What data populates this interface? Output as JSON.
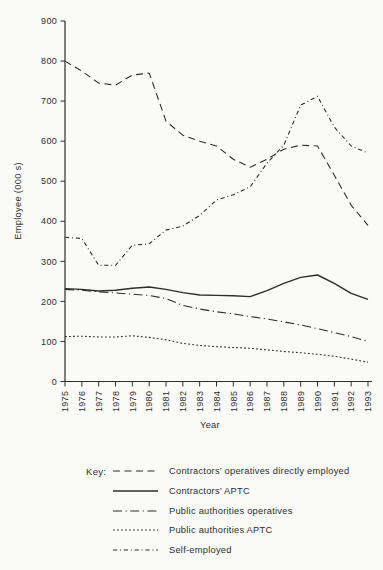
{
  "figure": {
    "y_axis_label": "Employee (000 s)",
    "x_axis_label": "Year"
  },
  "key": {
    "title": "Key:",
    "items": [
      {
        "label": "Contractors’ operatives directly employed",
        "style": "dashed"
      },
      {
        "label": "Contractors’ APTC",
        "style": "solid"
      },
      {
        "label": "Public authorities operatives",
        "style": "long-dash-dot"
      },
      {
        "label": "Public authorities APTC",
        "style": "dotted"
      },
      {
        "label": "Self-employed",
        "style": "dash-dot"
      }
    ]
  },
  "chart_data": {
    "type": "line",
    "title": "",
    "xlabel": "Year",
    "ylabel": "Employee (000 s)",
    "x": [
      1975,
      1976,
      1977,
      1978,
      1979,
      1980,
      1981,
      1982,
      1983,
      1984,
      1985,
      1986,
      1987,
      1988,
      1989,
      1990,
      1991,
      1992,
      1993
    ],
    "ylim": [
      0,
      900
    ],
    "ytick_step": 100,
    "grid": false,
    "legend_position": "below",
    "line_color": "#2e2e2e",
    "series": [
      {
        "name": "Contractors’ operatives directly employed",
        "style": "dashed",
        "values": [
          800,
          775,
          745,
          740,
          765,
          770,
          650,
          615,
          600,
          588,
          555,
          535,
          555,
          580,
          590,
          588,
          515,
          440,
          390
        ]
      },
      {
        "name": "Contractors’ APTC",
        "style": "solid",
        "values": [
          232,
          230,
          226,
          228,
          233,
          236,
          230,
          222,
          216,
          215,
          214,
          212,
          227,
          245,
          260,
          266,
          245,
          220,
          205
        ]
      },
      {
        "name": "Public authorities operatives",
        "style": "long-dash-dot",
        "values": [
          230,
          228,
          224,
          221,
          218,
          215,
          207,
          190,
          181,
          174,
          169,
          162,
          156,
          149,
          141,
          132,
          122,
          112,
          100
        ]
      },
      {
        "name": "Public authorities APTC",
        "style": "dotted",
        "values": [
          112,
          113,
          111,
          111,
          114,
          110,
          104,
          95,
          90,
          87,
          85,
          83,
          79,
          75,
          72,
          68,
          63,
          56,
          48
        ]
      },
      {
        "name": "Self-employed",
        "style": "dash-dot",
        "values": [
          360,
          357,
          290,
          290,
          340,
          344,
          378,
          388,
          415,
          453,
          466,
          486,
          545,
          590,
          690,
          712,
          635,
          588,
          570
        ]
      }
    ]
  }
}
